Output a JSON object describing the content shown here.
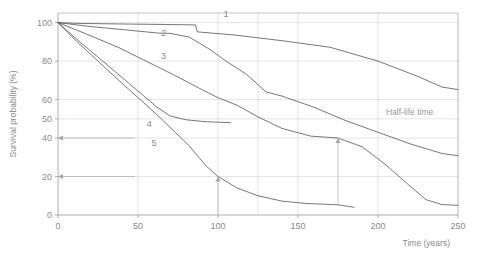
{
  "chart_data": {
    "type": "line",
    "title": "",
    "xlabel": "Time (years)",
    "ylabel": "Survival probability (%)",
    "xlim": [
      0,
      250
    ],
    "ylim": [
      0,
      105
    ],
    "xticks": [
      0,
      50,
      100,
      150,
      200,
      250
    ],
    "yticks": [
      0,
      20,
      40,
      50,
      60,
      80,
      100
    ],
    "grid": true,
    "legend": "inline curve numbers",
    "annotations": [
      {
        "name": "half-life-time",
        "text": "Half-life time",
        "x": 205,
        "y": 52
      },
      {
        "name": "arrow-up-at-100",
        "from_x": 100,
        "from_y": 0,
        "to_x": 100,
        "to_y": 20
      },
      {
        "name": "arrow-up-at-175",
        "from_x": 175,
        "from_y": 5,
        "to_x": 175,
        "to_y": 40
      },
      {
        "name": "arrow-left-at-40",
        "from_x": 48,
        "from_y": 40,
        "to_x": 0,
        "to_y": 40
      },
      {
        "name": "arrow-left-at-20",
        "from_x": 48,
        "from_y": 20,
        "to_x": 0,
        "to_y": 20
      }
    ],
    "series": [
      {
        "name": "1",
        "label": "1",
        "label_x": 105,
        "label_y": 103,
        "points": [
          [
            0,
            100
          ],
          [
            12,
            99.6
          ],
          [
            40,
            99.3
          ],
          [
            70,
            99.0
          ],
          [
            86,
            98.8
          ],
          [
            87,
            95.2
          ],
          [
            110,
            93.6
          ],
          [
            140,
            90.6
          ],
          [
            170,
            87.2
          ],
          [
            200,
            80.0
          ],
          [
            225,
            72.0
          ],
          [
            240,
            66.5
          ],
          [
            250,
            65.2
          ]
        ]
      },
      {
        "name": "2",
        "label": "2",
        "label_x": 66,
        "label_y": 93,
        "points": [
          [
            0,
            100
          ],
          [
            20,
            98.0
          ],
          [
            45,
            96.0
          ],
          [
            62,
            94.6
          ],
          [
            70,
            94.4
          ],
          [
            82,
            92.5
          ],
          [
            95,
            86.0
          ],
          [
            105,
            80.0
          ],
          [
            118,
            73.0
          ],
          [
            130,
            64.0
          ],
          [
            140,
            61.8
          ],
          [
            160,
            56.0
          ],
          [
            180,
            49.0
          ],
          [
            200,
            43.0
          ],
          [
            220,
            37.0
          ],
          [
            240,
            32.0
          ],
          [
            250,
            30.8
          ]
        ]
      },
      {
        "name": "3",
        "label": "3",
        "label_x": 66,
        "label_y": 81,
        "points": [
          [
            0,
            100
          ],
          [
            18,
            94.0
          ],
          [
            38,
            87.0
          ],
          [
            55,
            80.0
          ],
          [
            72,
            73.0
          ],
          [
            88,
            66.0
          ],
          [
            100,
            61.0
          ],
          [
            112,
            57.0
          ],
          [
            125,
            51.0
          ],
          [
            140,
            45.0
          ],
          [
            158,
            41.0
          ],
          [
            175,
            40.0
          ],
          [
            190,
            35.5
          ],
          [
            205,
            26.0
          ],
          [
            220,
            15.0
          ],
          [
            230,
            8.0
          ],
          [
            240,
            5.4
          ],
          [
            250,
            5.0
          ]
        ]
      },
      {
        "name": "4",
        "label": "4",
        "label_x": 57,
        "label_y": 46,
        "points": [
          [
            0,
            100
          ],
          [
            15,
            89.0
          ],
          [
            28,
            80.0
          ],
          [
            40,
            71.5
          ],
          [
            52,
            63.0
          ],
          [
            62,
            56.0
          ],
          [
            70,
            51.5
          ],
          [
            80,
            49.5
          ],
          [
            92,
            48.5
          ],
          [
            108,
            48.0
          ]
        ]
      },
      {
        "name": "5",
        "label": "5",
        "label_x": 60,
        "label_y": 36,
        "points": [
          [
            0,
            100
          ],
          [
            12,
            90.0
          ],
          [
            25,
            80.0
          ],
          [
            38,
            70.0
          ],
          [
            50,
            61.0
          ],
          [
            62,
            52.0
          ],
          [
            72,
            44.0
          ],
          [
            82,
            36.0
          ],
          [
            92,
            26.0
          ],
          [
            100,
            20.0
          ],
          [
            112,
            14.0
          ],
          [
            125,
            10.0
          ],
          [
            140,
            7.2
          ],
          [
            155,
            6.0
          ],
          [
            175,
            5.3
          ],
          [
            185,
            4.0
          ]
        ]
      }
    ]
  }
}
